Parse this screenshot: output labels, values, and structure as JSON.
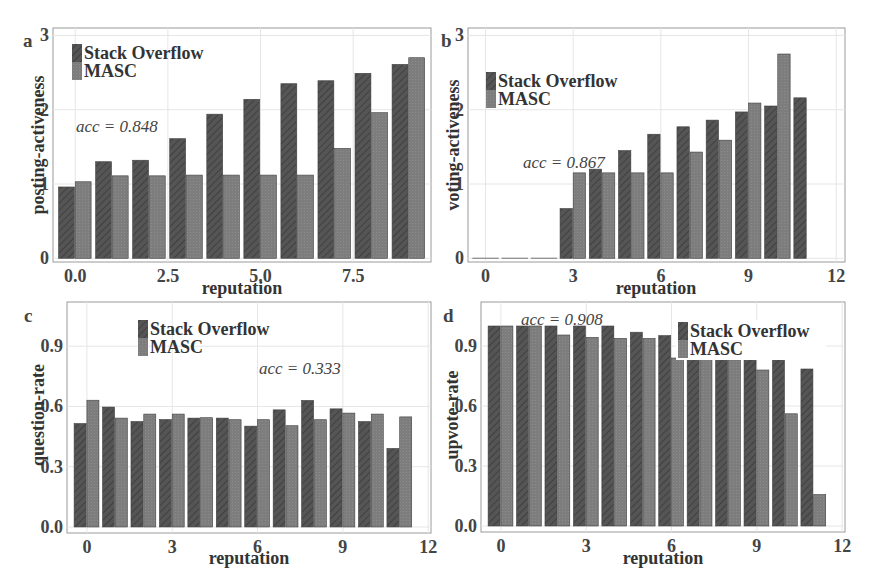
{
  "figure": {
    "legend": {
      "series_a": "Stack Overflow",
      "series_b": "MASC"
    },
    "colors": {
      "stack_overflow": "#555555",
      "masc": "#7d7d7d",
      "frame": "#9a9a9a",
      "grid": "#e6e6e6",
      "text": "#333333"
    }
  },
  "chart_data": [
    {
      "panel": "a",
      "type": "bar",
      "title": "",
      "xlabel": "reputation",
      "ylabel": "posting-activeness",
      "annotation": "acc = 0.848",
      "xlim": [
        -0.6,
        9.6
      ],
      "ylim": [
        -0.05,
        3.1
      ],
      "xticks": [
        0.0,
        2.5,
        5.0,
        7.5
      ],
      "xtick_labels": [
        "0.0",
        "2.5",
        "5.0",
        "7.5"
      ],
      "yticks": [
        0,
        1,
        2,
        3
      ],
      "ytick_labels": [
        "0",
        "1",
        "2",
        "3"
      ],
      "legend_position": "top-left",
      "x": [
        0,
        1,
        2,
        3,
        4,
        5,
        6,
        7,
        8,
        9
      ],
      "series": [
        {
          "name": "Stack Overflow",
          "values": [
            0.96,
            1.3,
            1.32,
            1.61,
            1.94,
            2.14,
            2.35,
            2.39,
            2.49,
            2.61
          ]
        },
        {
          "name": "MASC",
          "values": [
            1.03,
            1.11,
            1.11,
            1.12,
            1.12,
            1.12,
            1.12,
            1.48,
            1.96,
            2.7
          ]
        }
      ]
    },
    {
      "panel": "b",
      "type": "bar",
      "title": "",
      "xlabel": "reputation",
      "ylabel": "voting-activeness",
      "annotation": "acc = 0.867",
      "xlim": [
        -0.6,
        12.3
      ],
      "ylim": [
        -0.05,
        3.1
      ],
      "xticks": [
        0,
        3,
        6,
        9,
        12
      ],
      "xtick_labels": [
        "0",
        "3",
        "6",
        "9",
        "12"
      ],
      "yticks": [
        0,
        1,
        2,
        3
      ],
      "ytick_labels": [
        "0",
        "1",
        "2",
        "3"
      ],
      "legend_position": "upper-left",
      "x": [
        0,
        1,
        2,
        3,
        4,
        5,
        6,
        7,
        8,
        9,
        10,
        11
      ],
      "series": [
        {
          "name": "Stack Overflow",
          "values": [
            0,
            0,
            0,
            0.67,
            1.2,
            1.45,
            1.67,
            1.77,
            1.86,
            1.97,
            2.05,
            2.16
          ]
        },
        {
          "name": "MASC",
          "values": [
            0,
            0,
            0,
            1.15,
            1.15,
            1.15,
            1.15,
            1.43,
            1.59,
            2.09,
            2.75,
            null
          ]
        }
      ]
    },
    {
      "panel": "c",
      "type": "bar",
      "title": "",
      "xlabel": "reputation",
      "ylabel": "question-rate",
      "annotation": "acc = 0.333",
      "xlim": [
        -0.7,
        12.1
      ],
      "ylim": [
        -0.03,
        1.12
      ],
      "xticks": [
        0,
        3,
        6,
        9,
        12
      ],
      "xtick_labels": [
        "0",
        "3",
        "6",
        "9",
        "12"
      ],
      "yticks": [
        0.0,
        0.3,
        0.6,
        0.9
      ],
      "ytick_labels": [
        "0.0",
        "0.3",
        "0.6",
        "0.9"
      ],
      "legend_position": "top-center",
      "x": [
        0,
        1,
        2,
        3,
        4,
        5,
        6,
        7,
        8,
        9,
        10,
        11
      ],
      "series": [
        {
          "name": "Stack Overflow",
          "values": [
            0.515,
            0.597,
            0.525,
            0.535,
            0.542,
            0.542,
            0.502,
            0.583,
            0.63,
            0.588,
            0.525,
            0.391
          ]
        },
        {
          "name": "MASC",
          "values": [
            0.631,
            0.542,
            0.562,
            0.562,
            0.544,
            0.534,
            0.534,
            0.504,
            0.534,
            0.567,
            0.562,
            0.548
          ]
        }
      ]
    },
    {
      "panel": "d",
      "type": "bar",
      "title": "",
      "xlabel": "reputation",
      "ylabel": "upvote-rate",
      "annotation": "acc = 0.908",
      "xlim": [
        -0.7,
        12.1
      ],
      "ylim": [
        -0.03,
        1.12
      ],
      "xticks": [
        0,
        3,
        6,
        9,
        12
      ],
      "xtick_labels": [
        "0",
        "3",
        "6",
        "9",
        "12"
      ],
      "yticks": [
        0.0,
        0.3,
        0.6,
        0.9
      ],
      "ytick_labels": [
        "0.0",
        "0.3",
        "0.6",
        "0.9"
      ],
      "legend_position": "top-right",
      "x": [
        0,
        1,
        2,
        3,
        4,
        5,
        6,
        7,
        8,
        9,
        10,
        11
      ],
      "series": [
        {
          "name": "Stack Overflow",
          "values": [
            1.0,
            1.0,
            1.0,
            1.0,
            1.0,
            0.969,
            0.952,
            0.84,
            0.84,
            0.84,
            0.84,
            0.785
          ]
        },
        {
          "name": "MASC",
          "values": [
            1.0,
            1.0,
            0.955,
            0.943,
            0.938,
            0.938,
            0.84,
            0.84,
            0.831,
            0.78,
            0.561,
            0.157
          ]
        }
      ]
    }
  ],
  "panels": {
    "a": {
      "letter": "a",
      "ylabel": "posting-activeness",
      "xlabel": "reputation",
      "acc": "acc = 0.848"
    },
    "b": {
      "letter": "b",
      "ylabel": "voting-activeness",
      "xlabel": "reputation",
      "acc": "acc = 0.867"
    },
    "c": {
      "letter": "c",
      "ylabel": "question-rate",
      "xlabel": "reputation",
      "acc": "acc = 0.333"
    },
    "d": {
      "letter": "d",
      "ylabel": "upvote-rate",
      "xlabel": "reputation",
      "acc": "acc = 0.908"
    }
  }
}
